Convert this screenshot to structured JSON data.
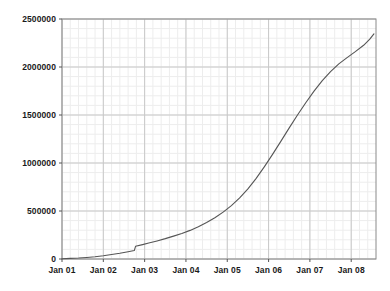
{
  "chart_data": {
    "type": "line",
    "title": "",
    "subtitle": "",
    "xlabel": "",
    "ylabel": "",
    "grid": true,
    "legend": null,
    "legend_position": "none",
    "xlim": [
      0,
      7.6
    ],
    "ylim": [
      0,
      2500000
    ],
    "yticks": [
      0,
      500000,
      1000000,
      1500000,
      2000000,
      2500000
    ],
    "ytick_labels": [
      "0",
      "500000",
      "1000000",
      "1500000",
      "2000000",
      "2500000"
    ],
    "xticks": [
      0,
      1,
      2,
      3,
      4,
      5,
      6,
      7
    ],
    "xtick_labels": [
      "Jan 01",
      "Jan 02",
      "Jan 03",
      "Jan 04",
      "Jan 05",
      "Jan 06",
      "Jan 07",
      "Jan 08"
    ],
    "minor_grid": true,
    "line_color": "#555555",
    "grid_color": "#c8c8c8",
    "minor_grid_color": "#ededed",
    "axis_color": "#808080",
    "series": [
      {
        "name": "cumulative",
        "x": [
          0.0,
          0.2,
          0.4,
          0.6,
          0.8,
          1.0,
          1.2,
          1.4,
          1.6,
          1.75,
          1.78,
          1.95,
          2.1,
          2.3,
          2.5,
          2.7,
          2.9,
          3.1,
          3.3,
          3.5,
          3.7,
          3.9,
          4.1,
          4.3,
          4.5,
          4.7,
          4.9,
          5.1,
          5.3,
          5.5,
          5.7,
          5.9,
          6.1,
          6.3,
          6.5,
          6.7,
          6.9,
          7.1,
          7.3,
          7.45,
          7.55
        ],
        "y": [
          3000,
          6000,
          10000,
          16000,
          24000,
          34000,
          46000,
          60000,
          76000,
          88000,
          132000,
          150000,
          166000,
          188000,
          212000,
          238000,
          266000,
          298000,
          336000,
          380000,
          430000,
          488000,
          556000,
          636000,
          730000,
          840000,
          962000,
          1092000,
          1228000,
          1366000,
          1500000,
          1628000,
          1748000,
          1858000,
          1952000,
          2032000,
          2098000,
          2160000,
          2226000,
          2290000,
          2345000
        ]
      }
    ]
  }
}
